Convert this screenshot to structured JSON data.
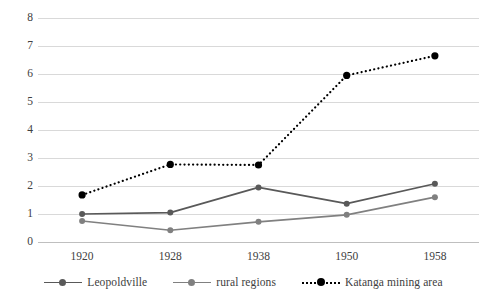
{
  "chart_data": {
    "type": "line",
    "title": "",
    "subtitle": "",
    "xlabel": "",
    "ylabel": "",
    "categories": [
      "1920",
      "1928",
      "1938",
      "1950",
      "1958"
    ],
    "x": [
      1920,
      1928,
      1938,
      1950,
      1958
    ],
    "ylim": [
      0,
      8
    ],
    "xlim": [
      1920,
      1958
    ],
    "y_ticks": [
      "0",
      "1",
      "2",
      "3",
      "4",
      "5",
      "6",
      "7",
      "8"
    ],
    "y_tick_values": [
      0,
      1,
      2,
      3,
      4,
      5,
      6,
      7,
      8
    ],
    "grid": true,
    "grid_axis": "y",
    "legend_position": "bottom",
    "series": [
      {
        "name": "Leopoldville",
        "values": [
          1.0,
          1.05,
          1.95,
          1.37,
          2.08
        ],
        "color": "#595959",
        "style": "solid",
        "marker": "circle"
      },
      {
        "name": "rural regions",
        "values": [
          0.75,
          0.42,
          0.72,
          0.97,
          1.6
        ],
        "color": "#808080",
        "style": "solid",
        "marker": "circle"
      },
      {
        "name": "Katanga mining area",
        "values": [
          1.68,
          2.77,
          2.75,
          5.95,
          6.65
        ],
        "color": "#000000",
        "style": "dotted",
        "marker": "circle"
      }
    ],
    "colors": {
      "gridline": "#d9d9d9",
      "axis": "#bfbfbf",
      "text": "#404040",
      "background": "#ffffff"
    }
  },
  "legend": {
    "items": [
      {
        "label": "Leopoldville"
      },
      {
        "label": "rural regions"
      },
      {
        "label": "Katanga mining area"
      }
    ]
  }
}
